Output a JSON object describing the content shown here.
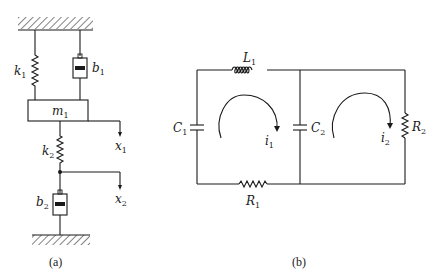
{
  "figure_a": {
    "caption": "(a)",
    "components": [
      {
        "id": "k1",
        "type": "spring",
        "label": "k",
        "sub": "1"
      },
      {
        "id": "b1",
        "type": "damper",
        "label": "b",
        "sub": "1"
      },
      {
        "id": "m1",
        "type": "mass",
        "label": "m",
        "sub": "1"
      },
      {
        "id": "k2",
        "type": "spring",
        "label": "k",
        "sub": "2"
      },
      {
        "id": "b2",
        "type": "damper",
        "label": "b",
        "sub": "2"
      }
    ],
    "displacements": [
      {
        "id": "x1",
        "label": "x",
        "sub": "1"
      },
      {
        "id": "x2",
        "label": "x",
        "sub": "2"
      }
    ],
    "k1": {
      "label": "k",
      "sub": "1"
    },
    "b1": {
      "label": "b",
      "sub": "1"
    },
    "m1": {
      "label": "m",
      "sub": "1"
    },
    "k2": {
      "label": "k",
      "sub": "2"
    },
    "b2": {
      "label": "b",
      "sub": "2"
    },
    "x1": {
      "label": "x",
      "sub": "1"
    },
    "x2": {
      "label": "x",
      "sub": "2"
    }
  },
  "figure_b": {
    "caption": "(b)",
    "components": [
      {
        "id": "L1",
        "type": "inductor",
        "label": "L",
        "sub": "1"
      },
      {
        "id": "C1",
        "type": "capacitor",
        "label": "C",
        "sub": "1"
      },
      {
        "id": "C2",
        "type": "capacitor",
        "label": "C",
        "sub": "2"
      },
      {
        "id": "R1",
        "type": "resistor",
        "label": "R",
        "sub": "1"
      },
      {
        "id": "R2",
        "type": "resistor",
        "label": "R",
        "sub": "2"
      }
    ],
    "loop_currents": [
      {
        "id": "i1",
        "label": "i",
        "sub": "1",
        "direction": "clockwise"
      },
      {
        "id": "i2",
        "label": "i",
        "sub": "2",
        "direction": "clockwise"
      }
    ],
    "L1": {
      "label": "L",
      "sub": "1"
    },
    "C1": {
      "label": "C",
      "sub": "1"
    },
    "C2": {
      "label": "C",
      "sub": "2"
    },
    "R1": {
      "label": "R",
      "sub": "1"
    },
    "R2": {
      "label": "R",
      "sub": "2"
    },
    "i1": {
      "label": "i",
      "sub": "1"
    },
    "i2": {
      "label": "i",
      "sub": "2"
    }
  },
  "colors": {
    "ink": "#1a1a1a",
    "background": "#ffffff"
  }
}
